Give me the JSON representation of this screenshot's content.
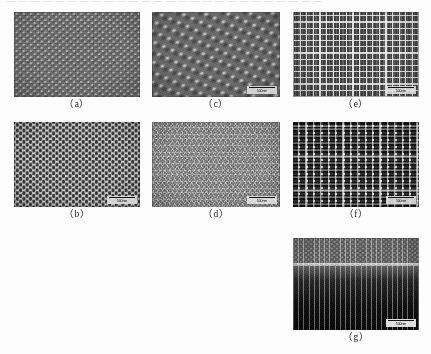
{
  "page": {
    "background_color": "#fdfdfd",
    "top_cutoff_text": "— — — — — — — — — — — — — — — — — — — — — — — — — —"
  },
  "figure": {
    "type": "sem-micrograph-grid",
    "panel_count": 7,
    "panels": [
      {
        "id": "a",
        "caption": "（a）",
        "pattern": "hexagonal array of hemispherical domes",
        "has_scalebar": false,
        "scalebar_label": "",
        "background_color": "#6f6f6f"
      },
      {
        "id": "b",
        "caption": "（b）",
        "pattern": "hexagonal close-packed dark circular holes with bright walls",
        "has_scalebar": true,
        "scalebar_label": "500nm",
        "background_color": "#cfcfcf"
      },
      {
        "id": "c",
        "caption": "（c）",
        "pattern": "tilted oblique view of slanted dome rows",
        "has_scalebar": true,
        "scalebar_label": "500nm",
        "background_color": "#6a6a6a"
      },
      {
        "id": "d",
        "caption": "（d）",
        "pattern": "fine hexagonal triangular mesh network",
        "has_scalebar": true,
        "scalebar_label": "500nm",
        "background_color": "#8d8d8d"
      },
      {
        "id": "e",
        "caption": "（e）",
        "pattern": "square grid array of bright-walled cells",
        "has_scalebar": true,
        "scalebar_label": "500nm",
        "background_color": "#5e5e5e"
      },
      {
        "id": "f",
        "caption": "（f）",
        "pattern": "square array of dark squares with bright ridges",
        "has_scalebar": true,
        "scalebar_label": "500nm",
        "background_color": "#d2d2d2"
      },
      {
        "id": "g",
        "caption": "（g）",
        "pattern": "cross-section view of vertical pillar array",
        "has_scalebar": true,
        "scalebar_label": "500nm",
        "background_color": "#141414"
      }
    ]
  }
}
